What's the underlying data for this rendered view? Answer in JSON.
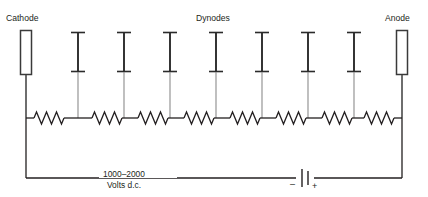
{
  "diagram": {
    "labels": {
      "cathode": "Cathode",
      "dynodes": "Dynodes",
      "anode": "Anode"
    },
    "supply": {
      "voltage_line1": "1000–2000",
      "voltage_line2": "Volts d.c.",
      "negative_sign": "–",
      "positive_sign": "+"
    },
    "colors": {
      "wire": "#231f20",
      "lead": "#8b8b8b",
      "electrode_stroke": "#3a3a3a",
      "background": "#ffffff"
    },
    "geometry": {
      "cathode": {
        "x": 20,
        "y": 30,
        "w": 12,
        "h": 45,
        "lead_x": 26,
        "lead_top": 75,
        "lead_bottom": 118
      },
      "anode": {
        "x": 396,
        "y": 30,
        "w": 12,
        "h": 45,
        "lead_x": 402,
        "lead_top": 75,
        "lead_bottom": 118
      },
      "dynode_xs": [
        78,
        124,
        170,
        216,
        262,
        308,
        354
      ],
      "dynode_top": 32,
      "dynode_bottom": 72,
      "dynode_cap_half": 7,
      "resistor_y": 118,
      "bus_left": 26,
      "bus_right": 402,
      "bottom_y": 178,
      "battery_x": 305,
      "resistor_count": 9
    },
    "components": {
      "resistor_count": 9,
      "dynode_count": 7,
      "electrode_count": 2,
      "battery_count": 1
    }
  }
}
